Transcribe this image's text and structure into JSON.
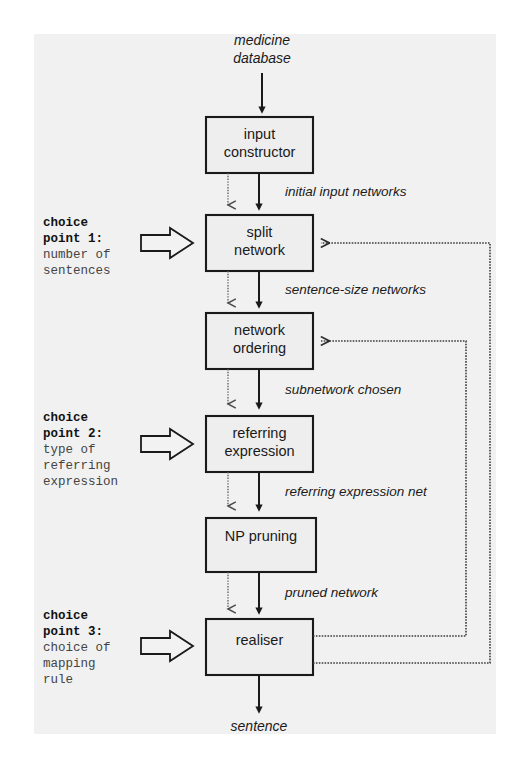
{
  "diagram": {
    "input_label": "medicine\ndatabase",
    "input_line1": "medicine",
    "input_line2": "database",
    "output_label": "sentence",
    "boxes": [
      {
        "id": "input-constructor",
        "line1": "input",
        "line2": "constructor"
      },
      {
        "id": "split-network",
        "line1": "split",
        "line2": "network"
      },
      {
        "id": "network-ordering",
        "line1": "network",
        "line2": "ordering"
      },
      {
        "id": "referring-expression",
        "line1": "referring",
        "line2": "expression"
      },
      {
        "id": "np-pruning",
        "line1": "NP pruning",
        "line2": ""
      },
      {
        "id": "realiser",
        "line1": "realiser",
        "line2": ""
      }
    ],
    "edge_labels": [
      {
        "id": "initial-input-networks",
        "text": "initial input networks"
      },
      {
        "id": "sentence-size-networks",
        "text": "sentence-size networks"
      },
      {
        "id": "subnetwork-chosen",
        "text": "subnetwork chosen"
      },
      {
        "id": "referring-expression-net",
        "text": "referring expression net"
      },
      {
        "id": "pruned-network",
        "text": "pruned network"
      }
    ],
    "choice_points": [
      {
        "id": "choice-point-1",
        "title_line1": "choice",
        "title_line2": "point 1:",
        "desc_lines": [
          "number of",
          "sentences"
        ]
      },
      {
        "id": "choice-point-2",
        "title_line1": "choice",
        "title_line2": "point 2:",
        "desc_lines": [
          "type of",
          "referring",
          "expression"
        ]
      },
      {
        "id": "choice-point-3",
        "title_line1": "choice",
        "title_line2": "point 3:",
        "desc_lines": [
          "choice of",
          "mapping",
          "rule"
        ]
      }
    ],
    "colors": {
      "paper": "#eeeeee",
      "ink": "#1a1a1a",
      "dotted": "#5a5a5a",
      "desc_text": "#444444"
    }
  }
}
